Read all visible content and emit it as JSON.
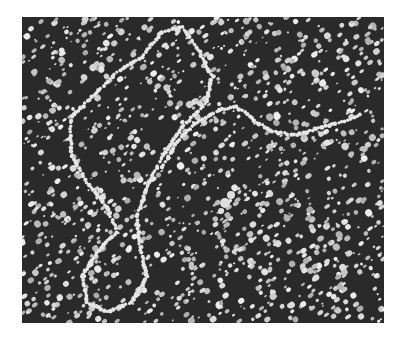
{
  "image": {
    "kind": "electron-micrograph",
    "subject": "DNA strand on speckled background",
    "colors": {
      "background": "#2a2a2a",
      "speckle": "#d8d8d8",
      "strand": "#e6e6e6",
      "page": "#ffffff"
    },
    "frame": {
      "left": 22,
      "top": 17,
      "width": 362,
      "height": 306
    }
  }
}
